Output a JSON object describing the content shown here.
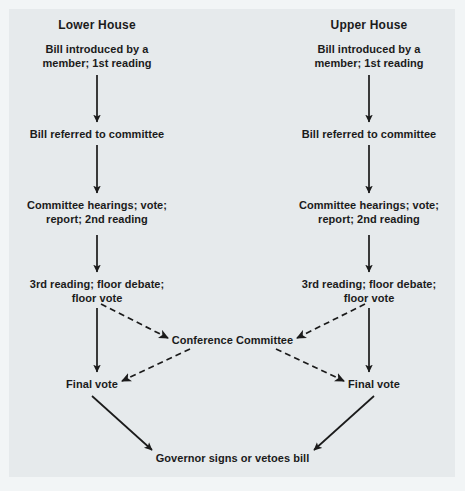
{
  "diagram": {
    "background_color": "#e6eaec",
    "text_color": "#1b1b1b",
    "line_color": "#1b1b1b",
    "columns": [
      {
        "id": "lower",
        "header": "Lower House",
        "center_x": 97
      },
      {
        "id": "upper",
        "header": "Upper House",
        "center_x": 369
      }
    ],
    "stages": [
      {
        "id": "introduced",
        "label": "Bill introduced by a\nmember; 1st reading"
      },
      {
        "id": "referred",
        "label": "Bill referred to committee"
      },
      {
        "id": "committee",
        "label": "Committee hearings; vote;\nreport; 2nd reading"
      },
      {
        "id": "third-reading",
        "label": "3rd reading; floor debate;\nfloor vote"
      },
      {
        "id": "final-vote",
        "label": "Final vote"
      }
    ],
    "nodes": {
      "lower_introduced": "Bill introduced by a\nmember; 1st reading",
      "lower_referred": "Bill referred to committee",
      "lower_committee": "Committee hearings; vote;\nreport; 2nd reading",
      "lower_third": "3rd reading; floor debate;\nfloor vote",
      "lower_final": "Final vote",
      "upper_introduced": "Bill introduced by a\nmember; 1st reading",
      "upper_referred": "Bill referred to committee",
      "upper_committee": "Committee hearings; vote;\nreport; 2nd reading",
      "upper_third": "3rd reading; floor debate;\nfloor vote",
      "upper_final": "Final vote",
      "conference": "Conference Committee",
      "governor": "Governor signs or vetoes bill"
    },
    "edges": [
      {
        "from": "lower_introduced",
        "to": "lower_referred",
        "style": "solid"
      },
      {
        "from": "lower_referred",
        "to": "lower_committee",
        "style": "solid"
      },
      {
        "from": "lower_committee",
        "to": "lower_third",
        "style": "solid"
      },
      {
        "from": "lower_third",
        "to": "lower_final",
        "style": "solid"
      },
      {
        "from": "upper_introduced",
        "to": "upper_referred",
        "style": "solid"
      },
      {
        "from": "upper_referred",
        "to": "upper_committee",
        "style": "solid"
      },
      {
        "from": "upper_committee",
        "to": "upper_third",
        "style": "solid"
      },
      {
        "from": "upper_third",
        "to": "upper_final",
        "style": "solid"
      },
      {
        "from": "lower_third",
        "to": "conference",
        "style": "dashed"
      },
      {
        "from": "upper_third",
        "to": "conference",
        "style": "dashed"
      },
      {
        "from": "conference",
        "to": "lower_final",
        "style": "dashed"
      },
      {
        "from": "conference",
        "to": "upper_final",
        "style": "dashed"
      },
      {
        "from": "lower_final",
        "to": "governor",
        "style": "solid"
      },
      {
        "from": "upper_final",
        "to": "governor",
        "style": "solid"
      }
    ]
  }
}
